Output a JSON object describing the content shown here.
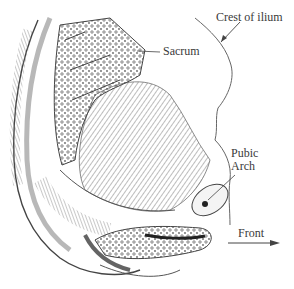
{
  "figure": {
    "labels": {
      "crest_of_ilium": "Crest of ilium",
      "sacrum": "Sacrum",
      "pubic_arch_line1": "Pubic",
      "pubic_arch_line2": "Arch",
      "front": "Front"
    },
    "colors": {
      "ink": "#3a3a3a",
      "background": "#ffffff",
      "shade": "#555555"
    }
  }
}
